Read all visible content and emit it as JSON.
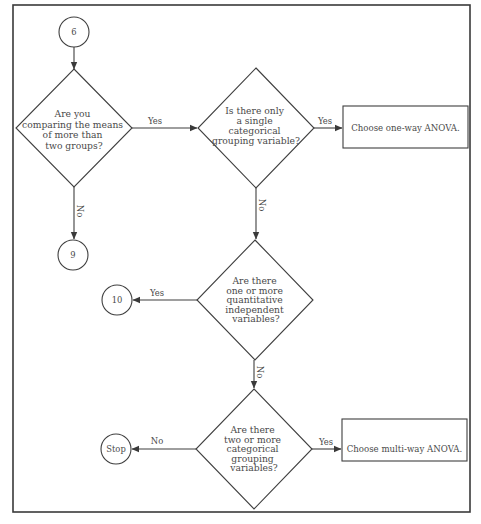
{
  "diagram": {
    "title": "",
    "frame": {
      "x": 13,
      "y": 5,
      "w": 457,
      "h": 507
    },
    "nodes": {
      "c6": {
        "type": "circle",
        "label": "6",
        "cx": 74,
        "cy": 32,
        "r": 15
      },
      "d1": {
        "type": "decision",
        "cx": 74,
        "cy": 128,
        "hw": 58,
        "hh": 59,
        "lines": [
          "Are you",
          "comparing the means",
          "of more than",
          "two groups?"
        ]
      },
      "c9": {
        "type": "circle",
        "label": "9",
        "cx": 73,
        "cy": 255,
        "r": 15
      },
      "d2": {
        "type": "decision",
        "cx": 256,
        "cy": 128,
        "hw": 58,
        "hh": 60,
        "lines": [
          "Is there only",
          "a single",
          "categorical",
          "grouping variable?"
        ]
      },
      "b1": {
        "type": "process",
        "label": "Choose one-way ANOVA.",
        "x": 343,
        "y": 106,
        "w": 125,
        "h": 42
      },
      "d3": {
        "type": "decision",
        "cx": 255,
        "cy": 300,
        "hw": 58,
        "hh": 60,
        "lines": [
          "Are there",
          "one or more",
          "quantitative",
          "independent",
          "variables?"
        ]
      },
      "c10": {
        "type": "circle",
        "label": "10",
        "cx": 117,
        "cy": 300,
        "r": 15
      },
      "d4": {
        "type": "decision",
        "cx": 254,
        "cy": 449,
        "hw": 58,
        "hh": 60,
        "lines": [
          "Are there",
          "two or more",
          "categorical",
          "grouping",
          "variables?"
        ]
      },
      "stop": {
        "type": "circle",
        "label": "Stop",
        "cx": 116,
        "cy": 448,
        "r": 15
      },
      "b2": {
        "type": "process",
        "label": "Choose multi-way ANOVA.",
        "x": 342,
        "y": 419,
        "w": 125,
        "h": 42
      }
    },
    "edges": [
      {
        "from": "c6",
        "to": "d1",
        "label": ""
      },
      {
        "from": "d1",
        "to": "d2",
        "label": "Yes"
      },
      {
        "from": "d1",
        "to": "c9",
        "label": "No"
      },
      {
        "from": "d2",
        "to": "b1",
        "label": "Yes"
      },
      {
        "from": "d2",
        "to": "d3",
        "label": "No"
      },
      {
        "from": "d3",
        "to": "c10",
        "label": "Yes"
      },
      {
        "from": "d3",
        "to": "d4",
        "label": "No"
      },
      {
        "from": "d4",
        "to": "stop",
        "label": "No"
      },
      {
        "from": "d4",
        "to": "b2",
        "label": "Yes"
      }
    ]
  },
  "labels": {
    "yes": "Yes",
    "no": "No"
  }
}
